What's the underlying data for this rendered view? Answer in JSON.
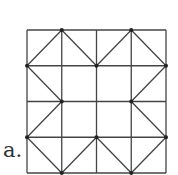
{
  "figure": {
    "label": "a.",
    "grid": {
      "rows": 4,
      "cols": 4,
      "left": 27,
      "top": 30,
      "width": 139,
      "height": 143,
      "line_color": "#444444"
    },
    "diagonals": [
      {
        "col": 0,
        "row": 0,
        "dir": "/"
      },
      {
        "col": 1,
        "row": 0,
        "dir": "\\"
      },
      {
        "col": 2,
        "row": 0,
        "dir": "/"
      },
      {
        "col": 3,
        "row": 0,
        "dir": "\\"
      },
      {
        "col": 0,
        "row": 1,
        "dir": "\\"
      },
      {
        "col": 3,
        "row": 1,
        "dir": "/"
      },
      {
        "col": 0,
        "row": 2,
        "dir": "/"
      },
      {
        "col": 3,
        "row": 2,
        "dir": "\\"
      },
      {
        "col": 0,
        "row": 3,
        "dir": "\\"
      },
      {
        "col": 1,
        "row": 3,
        "dir": "/"
      },
      {
        "col": 2,
        "row": 3,
        "dir": "\\"
      },
      {
        "col": 3,
        "row": 3,
        "dir": "/"
      }
    ],
    "vertex_dots": [
      [
        1,
        0
      ],
      [
        3,
        0
      ],
      [
        0,
        1
      ],
      [
        2,
        1
      ],
      [
        4,
        1
      ],
      [
        1,
        2
      ],
      [
        3,
        2
      ],
      [
        0,
        3
      ],
      [
        2,
        3
      ],
      [
        4,
        3
      ],
      [
        1,
        4
      ],
      [
        3,
        4
      ]
    ]
  }
}
